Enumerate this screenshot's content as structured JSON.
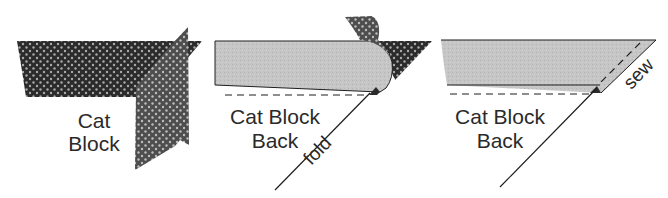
{
  "diagram": {
    "panels": [
      {
        "id": "step-1",
        "labels": {
          "line1": "Cat",
          "line2": "Block"
        }
      },
      {
        "id": "step-2",
        "labels": {
          "line1": "Cat Block",
          "line2": "Back",
          "fold": "fold"
        }
      },
      {
        "id": "step-3",
        "labels": {
          "line1": "Cat Block",
          "line2": "Back",
          "sew": "sew"
        }
      }
    ],
    "colors": {
      "dark_fabric": "#2b2b2b",
      "dot": "#b8b8b8",
      "medium_fabric": "#5a5a5a",
      "light_fabric": "#c9c9c9",
      "line": "#1e1e1e",
      "background": "#ffffff"
    }
  }
}
